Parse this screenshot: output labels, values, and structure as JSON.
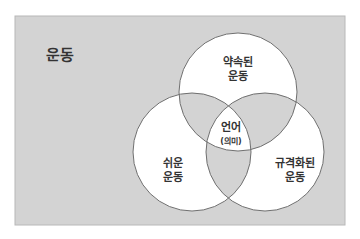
{
  "diagram": {
    "type": "venn",
    "universe": {
      "label": "운동",
      "fill": "#d3d3d3",
      "stroke": "#b8b8b8"
    },
    "sets": [
      {
        "id": "promised",
        "label_line1": "약속된",
        "label_line2": "운동"
      },
      {
        "id": "easy",
        "label_line1": "쉬운",
        "label_line2": "운동"
      },
      {
        "id": "regular",
        "label_line1": "규격화된",
        "label_line2": "운동"
      }
    ],
    "center": {
      "label_line1": "언어",
      "label_line2": "(의미)"
    },
    "colors": {
      "circle_fill": "#ffffff",
      "overlap_fill": "#d3d3d3",
      "circle_stroke": "#6f6f6f",
      "text": "#333333"
    }
  }
}
